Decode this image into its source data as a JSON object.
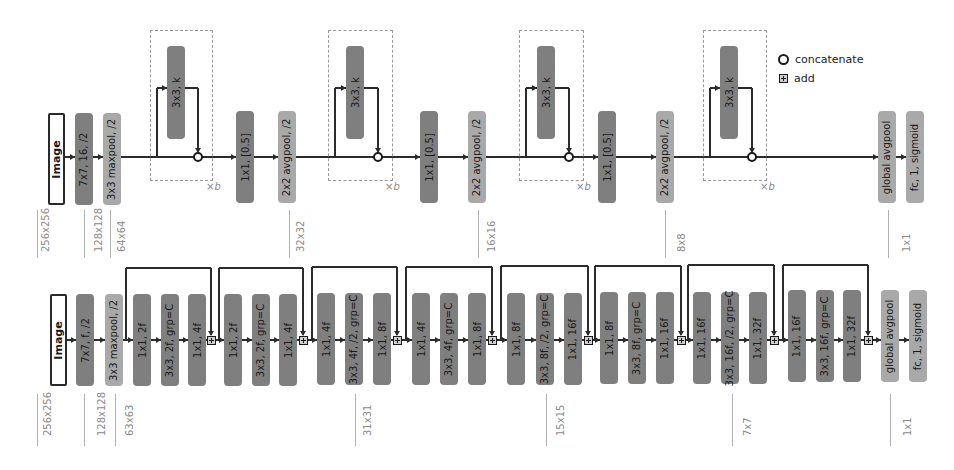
{
  "legend": {
    "concatenate": "concatenate",
    "add": "add"
  },
  "top_network": {
    "name": "densenet-style",
    "main_y": 157,
    "blocks": [
      {
        "id": "image",
        "label": "Image",
        "type": "image",
        "x": 48,
        "y": 113,
        "w": 17,
        "h": 92
      },
      {
        "id": "conv1",
        "label": "7x7, 16, /2",
        "type": "conv",
        "x": 75,
        "y": 113,
        "w": 18,
        "h": 92
      },
      {
        "id": "maxpool",
        "label": "3x3 maxpool, /2",
        "type": "pool",
        "x": 103,
        "y": 113,
        "w": 18,
        "h": 92
      },
      {
        "id": "dense1",
        "label": "3x3, k",
        "type": "conv",
        "x": 167,
        "y": 46,
        "w": 18,
        "h": 93
      },
      {
        "id": "trans1_conv",
        "label": "1x1, [0.5]",
        "type": "conv",
        "x": 236,
        "y": 111,
        "w": 18,
        "h": 92
      },
      {
        "id": "trans1_pool",
        "label": "2x2 avgpool, /2",
        "type": "pool",
        "x": 278,
        "y": 111,
        "w": 18,
        "h": 92
      },
      {
        "id": "dense2",
        "label": "3x3, k",
        "type": "conv",
        "x": 346,
        "y": 46,
        "w": 18,
        "h": 93
      },
      {
        "id": "trans2_conv",
        "label": "1x1, [0.5]",
        "type": "conv",
        "x": 420,
        "y": 111,
        "w": 18,
        "h": 92
      },
      {
        "id": "trans2_pool",
        "label": "2x2 avgpool, /2",
        "type": "pool",
        "x": 468,
        "y": 111,
        "w": 18,
        "h": 92
      },
      {
        "id": "dense3",
        "label": "3x3, k",
        "type": "conv",
        "x": 537,
        "y": 46,
        "w": 18,
        "h": 93
      },
      {
        "id": "trans3_conv",
        "label": "1x1, [0.5]",
        "type": "conv",
        "x": 598,
        "y": 111,
        "w": 18,
        "h": 92
      },
      {
        "id": "trans3_pool",
        "label": "2x2 avgpool, /2",
        "type": "pool",
        "x": 656,
        "y": 111,
        "w": 18,
        "h": 92
      },
      {
        "id": "dense4",
        "label": "3x3, k",
        "type": "conv",
        "x": 720,
        "y": 46,
        "w": 18,
        "h": 93
      },
      {
        "id": "gap",
        "label": "global avgpool",
        "type": "pool",
        "x": 878,
        "y": 111,
        "w": 18,
        "h": 92
      },
      {
        "id": "fc",
        "label": "fc, 1, sigmoid",
        "type": "pool",
        "x": 906,
        "y": 111,
        "w": 18,
        "h": 92
      }
    ],
    "dense_blocks": [
      {
        "box_x": 150,
        "box_y": 30,
        "box_w": 63,
        "box_h": 151,
        "branch_x": 157,
        "concat_x": 198,
        "repeat": "×b",
        "xb_x": 206,
        "xb_y": 181
      },
      {
        "box_x": 328,
        "box_y": 30,
        "box_w": 65,
        "box_h": 151,
        "branch_x": 335,
        "concat_x": 378,
        "repeat": "×b",
        "xb_x": 385,
        "xb_y": 181
      },
      {
        "box_x": 519,
        "box_y": 30,
        "box_w": 65,
        "box_h": 151,
        "branch_x": 526,
        "concat_x": 569,
        "repeat": "×b",
        "xb_x": 576,
        "xb_y": 181
      },
      {
        "box_x": 703,
        "box_y": 30,
        "box_w": 64,
        "box_h": 151,
        "branch_x": 710,
        "concat_x": 752,
        "repeat": "×b",
        "xb_x": 760,
        "xb_y": 181
      }
    ],
    "dimensions": [
      {
        "label": "256x256",
        "line_x": 37,
        "text_x": 40,
        "y1": 210,
        "y2": 258
      },
      {
        "label": "128x128",
        "line_x": 84,
        "text_x": 93,
        "y1": 210,
        "y2": 258
      },
      {
        "label": "64x64",
        "line_x": 110,
        "text_x": 116,
        "y1": 210,
        "y2": 258
      },
      {
        "label": "32x32",
        "line_x": 289,
        "text_x": 295,
        "y1": 210,
        "y2": 258
      },
      {
        "label": "16x16",
        "line_x": 478,
        "text_x": 486,
        "y1": 210,
        "y2": 258
      },
      {
        "label": "8x8",
        "line_x": 665,
        "text_x": 676,
        "y1": 210,
        "y2": 258
      },
      {
        "label": "1x1",
        "line_x": 888,
        "text_x": 901,
        "y1": 210,
        "y2": 258
      }
    ]
  },
  "bottom_network": {
    "name": "resnext-style",
    "main_y": 340,
    "blocks": [
      {
        "id": "image",
        "label": "Image",
        "type": "image",
        "x": 50,
        "y": 294,
        "w": 17,
        "h": 92
      },
      {
        "id": "conv1",
        "label": "7x7, f, /2",
        "type": "conv",
        "x": 76,
        "y": 294,
        "w": 18,
        "h": 92
      },
      {
        "id": "maxpool",
        "label": "3x3 maxpool, /2",
        "type": "pool",
        "x": 105,
        "y": 294,
        "w": 18,
        "h": 92
      },
      {
        "id": "b1_c1",
        "label": "1x1, 2f",
        "type": "conv",
        "x": 133,
        "y": 294,
        "w": 18,
        "h": 92
      },
      {
        "id": "b1_c2",
        "label": "3x3, 2f, grp=C",
        "type": "conv",
        "x": 161,
        "y": 294,
        "w": 18,
        "h": 92
      },
      {
        "id": "b1_c3",
        "label": "1x1, 4f",
        "type": "conv",
        "x": 188,
        "y": 294,
        "w": 18,
        "h": 92
      },
      {
        "id": "b2_c1",
        "label": "1x1, 2f",
        "type": "conv",
        "x": 224,
        "y": 294,
        "w": 18,
        "h": 92
      },
      {
        "id": "b2_c2",
        "label": "3x3, 2f, grp=C",
        "type": "conv",
        "x": 252,
        "y": 294,
        "w": 18,
        "h": 92
      },
      {
        "id": "b2_c3",
        "label": "1x1, 4f",
        "type": "conv",
        "x": 279,
        "y": 294,
        "w": 18,
        "h": 92
      },
      {
        "id": "b3_c1",
        "label": "1x1, 4f",
        "type": "conv",
        "x": 317,
        "y": 293,
        "w": 18,
        "h": 92
      },
      {
        "id": "b3_c2",
        "label": "3x3, 4f, /2, grp=C",
        "type": "conv",
        "x": 345,
        "y": 293,
        "w": 18,
        "h": 92
      },
      {
        "id": "b3_c3",
        "label": "1x1, 8f",
        "type": "conv",
        "x": 373,
        "y": 293,
        "w": 18,
        "h": 92
      },
      {
        "id": "b4_c1",
        "label": "1x1, 4f",
        "type": "conv",
        "x": 412,
        "y": 293,
        "w": 18,
        "h": 92
      },
      {
        "id": "b4_c2",
        "label": "3x3, 4f, grp=C",
        "type": "conv",
        "x": 440,
        "y": 293,
        "w": 18,
        "h": 92
      },
      {
        "id": "b4_c3",
        "label": "1x1, 8f",
        "type": "conv",
        "x": 468,
        "y": 293,
        "w": 18,
        "h": 92
      },
      {
        "id": "b5_c1",
        "label": "1x1, 8f",
        "type": "conv",
        "x": 507,
        "y": 293,
        "w": 18,
        "h": 92
      },
      {
        "id": "b5_c2",
        "label": "3x3, 8f, /2, grp=C",
        "type": "conv",
        "x": 536,
        "y": 293,
        "w": 18,
        "h": 92
      },
      {
        "id": "b5_c3",
        "label": "1x1, 16f",
        "type": "conv",
        "x": 564,
        "y": 293,
        "w": 18,
        "h": 92
      },
      {
        "id": "b6_c1",
        "label": "1x1, 8f",
        "type": "conv",
        "x": 600,
        "y": 292,
        "w": 18,
        "h": 92
      },
      {
        "id": "b6_c2",
        "label": "3x3, 8f, grp=C",
        "type": "conv",
        "x": 628,
        "y": 292,
        "w": 18,
        "h": 92
      },
      {
        "id": "b6_c3",
        "label": "1x1, 16f",
        "type": "conv",
        "x": 656,
        "y": 292,
        "w": 18,
        "h": 92
      },
      {
        "id": "b7_c1",
        "label": "1x1, 16f",
        "type": "conv",
        "x": 693,
        "y": 292,
        "w": 18,
        "h": 92
      },
      {
        "id": "b7_c2",
        "label": "3x3, 16f, /2, grp=C",
        "type": "conv",
        "x": 721,
        "y": 292,
        "w": 18,
        "h": 92
      },
      {
        "id": "b7_c3",
        "label": "1x1, 32f",
        "type": "conv",
        "x": 749,
        "y": 292,
        "w": 18,
        "h": 92
      },
      {
        "id": "b8_c1",
        "label": "1x1, 16f",
        "type": "conv",
        "x": 788,
        "y": 290,
        "w": 18,
        "h": 92
      },
      {
        "id": "b8_c2",
        "label": "3x3, 16f, grp=C",
        "type": "conv",
        "x": 816,
        "y": 290,
        "w": 18,
        "h": 92
      },
      {
        "id": "b8_c3",
        "label": "1x1, 32f",
        "type": "conv",
        "x": 843,
        "y": 290,
        "w": 18,
        "h": 92
      },
      {
        "id": "gap",
        "label": "global avgpool",
        "type": "pool",
        "x": 881,
        "y": 290,
        "w": 18,
        "h": 92
      },
      {
        "id": "fc",
        "label": "fc, 1, sigmoid",
        "type": "pool",
        "x": 909,
        "y": 290,
        "w": 18,
        "h": 92
      }
    ],
    "skips": [
      {
        "start_x": 126,
        "add_x": 211,
        "top_y": 268
      },
      {
        "start_x": 219,
        "add_x": 303,
        "top_y": 268
      },
      {
        "start_x": 312,
        "add_x": 397,
        "top_y": 267
      },
      {
        "start_x": 406,
        "add_x": 492,
        "top_y": 267
      },
      {
        "start_x": 501,
        "add_x": 588,
        "top_y": 266
      },
      {
        "start_x": 595,
        "add_x": 681,
        "top_y": 266
      },
      {
        "start_x": 688,
        "add_x": 774,
        "top_y": 265
      },
      {
        "start_x": 783,
        "add_x": 868,
        "top_y": 265
      }
    ],
    "dimensions": [
      {
        "label": "256x256",
        "line_x": 37,
        "text_x": 42,
        "y1": 394,
        "y2": 446
      },
      {
        "label": "128x128",
        "line_x": 84,
        "text_x": 96,
        "y1": 394,
        "y2": 446
      },
      {
        "label": "63x63",
        "line_x": 115,
        "text_x": 124,
        "y1": 394,
        "y2": 446
      },
      {
        "label": "31x31",
        "line_x": 355,
        "text_x": 362,
        "y1": 394,
        "y2": 446
      },
      {
        "label": "15x15",
        "line_x": 546,
        "text_x": 555,
        "y1": 394,
        "y2": 446
      },
      {
        "label": "7x7",
        "line_x": 732,
        "text_x": 742,
        "y1": 394,
        "y2": 446
      },
      {
        "label": "1x1",
        "line_x": 890,
        "text_x": 902,
        "y1": 394,
        "y2": 446
      }
    ]
  },
  "colors": {
    "conv": "#7f7f7f",
    "pool": "#a9a9a9",
    "line": "#2b2b2b",
    "dim_text": "#8a8a8a"
  }
}
